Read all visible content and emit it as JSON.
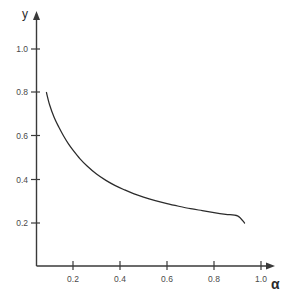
{
  "chart_data": {
    "type": "line",
    "title": "",
    "subtitle": "",
    "xlabel": "α",
    "ylabel": "y",
    "xlim": [
      0.0,
      1.12
    ],
    "ylim": [
      0.0,
      1.12
    ],
    "grid": false,
    "legend": null,
    "background_color": "#ffffff",
    "line_color": "#2b2b2b",
    "axis_color": "#3a3a3a",
    "x_ticks": [
      0.2,
      0.4,
      0.6,
      0.8,
      1.0
    ],
    "x_tick_labels": [
      "0.2",
      "0.4",
      "0.6",
      "0.8",
      "1.0"
    ],
    "y_ticks": [
      0.2,
      0.4,
      0.6,
      0.8,
      1.0
    ],
    "y_tick_labels": [
      "0.2",
      "0.4",
      "0.6",
      "0.8",
      "1.0"
    ],
    "series": [
      {
        "name": "curve",
        "x": [
          0.087,
          0.1,
          0.12,
          0.14,
          0.16,
          0.18,
          0.2,
          0.23,
          0.26,
          0.3,
          0.34,
          0.38,
          0.42,
          0.46,
          0.5,
          0.55,
          0.6,
          0.65,
          0.7,
          0.75,
          0.8,
          0.85,
          0.9,
          0.93
        ],
        "y": [
          0.8,
          0.745,
          0.685,
          0.64,
          0.6,
          0.565,
          0.535,
          0.495,
          0.462,
          0.425,
          0.396,
          0.372,
          0.352,
          0.334,
          0.319,
          0.303,
          0.289,
          0.277,
          0.266,
          0.257,
          0.248,
          0.24,
          0.233,
          0.2
        ]
      }
    ],
    "annotations": [],
    "x_axis_arrow": true,
    "y_axis_arrow": true
  },
  "labels": {
    "y_axis_label": "y",
    "x_axis_label": "α",
    "y_tick_1": "1.0",
    "y_tick_2": "0.8",
    "y_tick_3": "0.6",
    "y_tick_4": "0.4",
    "y_tick_5": "0.2",
    "x_tick_1": "0.2",
    "x_tick_2": "0.4",
    "x_tick_3": "0.6",
    "x_tick_4": "0.8",
    "x_tick_5": "1.0"
  }
}
